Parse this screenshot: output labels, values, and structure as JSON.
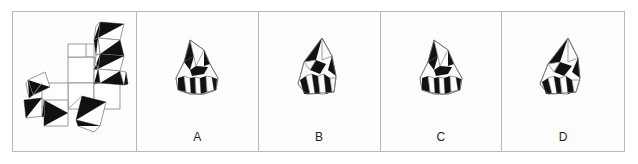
{
  "question": {
    "type": "spatial-reasoning-folding",
    "panel_count": 5,
    "frame_border_color": "#b9b9bb",
    "background_color": "#ffffff",
    "ink_color": "#111111"
  },
  "prompt_panel": {
    "name": "unfolded-net",
    "description": "Flat net of a polyhedron made of square and triangular tiles, each patterned with black and white triangles",
    "label": ""
  },
  "options": [
    {
      "id": "A",
      "label": "A",
      "description": "Folded solid: broad rounded form with pointed top, black triangle upper left, white triangle at apex centre, fluted black and white chevrons across the lower band"
    },
    {
      "id": "B",
      "label": "B",
      "description": "Folded solid: tall narrow spire, black wedge on upper left face, white triangle top right, vertical black and white stripes on the lower left face"
    },
    {
      "id": "C",
      "label": "C",
      "description": "Folded solid: broad rounded form with pointed top, black triangle upper left, white triangle at apex centre, fluted black and white chevrons across the lower band"
    },
    {
      "id": "D",
      "label": "D",
      "description": "Folded solid: tall spire, black wedge upper left, white face top right, black and white vertical flutes along the lower body"
    }
  ],
  "colors": {
    "ink": "#111111",
    "paper": "#ffffff",
    "edge": "#9a9a9e",
    "frame": "#b9b9bb",
    "label_text": "#231f20"
  }
}
